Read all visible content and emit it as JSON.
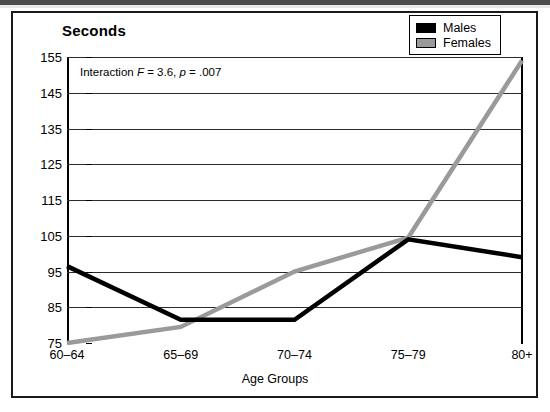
{
  "figure": {
    "title": "Seconds",
    "annotation": {
      "prefix": "Interaction ",
      "stat1_italic": "F",
      "stat1_value": " = 3.6, ",
      "stat2_italic": "p",
      "stat2_value": " = .007"
    }
  },
  "legend": {
    "position": "top-right",
    "items": [
      {
        "label": "Males",
        "color": "#000000"
      },
      {
        "label": "Females",
        "color": "#9a9a9a"
      }
    ]
  },
  "chart_data": {
    "type": "line",
    "title": "Seconds",
    "xlabel": "Age Groups",
    "ylabel": "Seconds",
    "categories": [
      "60–64",
      "65–69",
      "70–74",
      "75–79",
      "80+"
    ],
    "ylim": [
      75,
      155
    ],
    "yticks": [
      75,
      85,
      95,
      105,
      115,
      125,
      135,
      145,
      155
    ],
    "grid": true,
    "annotation_text": "Interaction F = 3.6, p = .007",
    "series": [
      {
        "name": "Males",
        "color": "#000000",
        "values": [
          96.5,
          81.5,
          81.5,
          104.0,
          99.0
        ]
      },
      {
        "name": "Females",
        "color": "#9a9a9a",
        "values": [
          75.0,
          79.5,
          95.0,
          104.5,
          154.0
        ]
      }
    ]
  }
}
